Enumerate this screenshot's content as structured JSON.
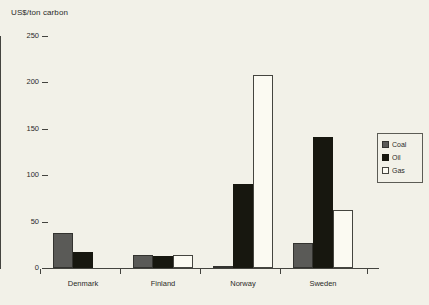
{
  "chart_data": {
    "type": "bar",
    "title": "US$/ton carbon",
    "xlabel": "",
    "ylabel": "US$/ton carbon",
    "categories": [
      "Denmark",
      "Finland",
      "Norway",
      "Sweden"
    ],
    "series": [
      {
        "name": "Coal",
        "color": "#5a5a57",
        "values": [
          38,
          14,
          2,
          27
        ]
      },
      {
        "name": "Oil",
        "color": "#17170f",
        "values": [
          17,
          13,
          91,
          141
        ]
      },
      {
        "name": "Gas",
        "color": "#fbfaf2",
        "values": [
          0,
          14,
          208,
          62
        ]
      }
    ],
    "ylim": [
      0,
      250
    ],
    "yticks": [
      0,
      50,
      100,
      150,
      200,
      250
    ],
    "ytick_labels": [
      "0",
      "50",
      "100",
      "150",
      "200",
      "250"
    ],
    "grid": false,
    "legend_position": "right"
  },
  "legend": {
    "items": [
      {
        "label": "Coal"
      },
      {
        "label": "Oil"
      },
      {
        "label": "Gas"
      }
    ]
  }
}
